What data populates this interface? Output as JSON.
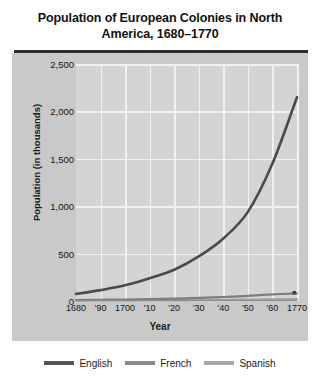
{
  "chart_data": {
    "type": "line",
    "title": "Population of European Colonies in North America, 1680–1770",
    "xlabel": "Year",
    "ylabel": "Population (in thousands)",
    "xlim": [
      1680,
      1770
    ],
    "ylim": [
      0,
      2500
    ],
    "grid": true,
    "legend_position": "bottom",
    "x": [
      1680,
      1690,
      1700,
      1710,
      1720,
      1730,
      1740,
      1750,
      1760,
      1770
    ],
    "xtick_labels": [
      "1680",
      "'90",
      "1700",
      "'10",
      "'20",
      "'30",
      "'40",
      "'50",
      "'60",
      "1770"
    ],
    "ytick_labels": [
      "0",
      "500",
      "1,000",
      "1,500",
      "2,000",
      "2,500"
    ],
    "ytick_values": [
      0,
      500,
      1000,
      1500,
      2000,
      2500
    ],
    "series": [
      {
        "name": "English",
        "color": "#4a4a4a",
        "values": [
          75,
          115,
          165,
          240,
          330,
          470,
          660,
          940,
          1450,
          2150
        ]
      },
      {
        "name": "French",
        "color": "#7d7d7d",
        "values": [
          10,
          13,
          16,
          20,
          25,
          32,
          42,
          55,
          70,
          80
        ]
      },
      {
        "name": "Spanish",
        "color": "#a0a0a0",
        "values": [
          5,
          6,
          7,
          8,
          9,
          11,
          13,
          15,
          17,
          19
        ]
      }
    ],
    "annotations": [
      {
        "name": "endpoint-marker",
        "x": 1770,
        "y": 80,
        "shape": "square"
      }
    ]
  },
  "legend": {
    "items": [
      {
        "label": "English",
        "color": "#555555"
      },
      {
        "label": "French",
        "color": "#8a8a8a"
      },
      {
        "label": "Spanish",
        "color": "#a8a8a8"
      }
    ]
  },
  "colors": {
    "panel_background": "#c9c9c9",
    "plot_background": "#d4d4d4",
    "gridline": "#f1f1f1",
    "title_rule": "#2e2e2e",
    "text": "#151515"
  }
}
